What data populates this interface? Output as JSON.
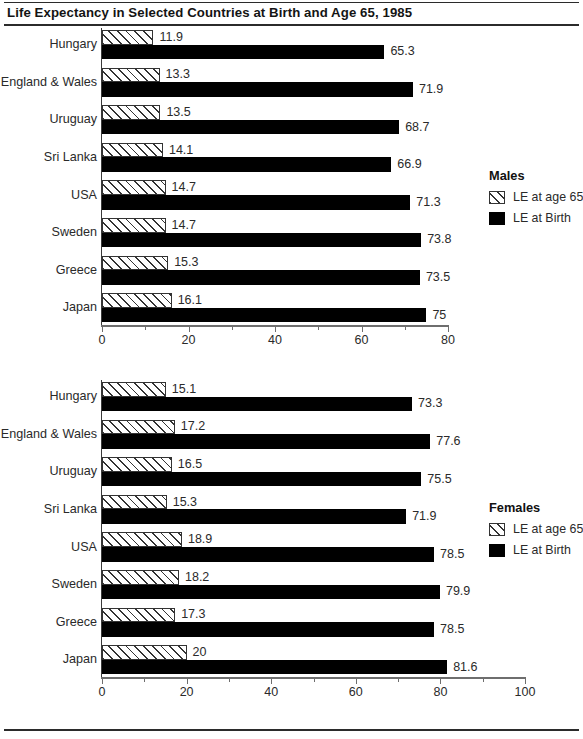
{
  "title": "Life Expectancy in Selected Countries at Birth and Age 65, 1985",
  "chart_data": [
    {
      "type": "bar",
      "id": "males",
      "title": "Males",
      "orientation": "horizontal",
      "grouping": "grouped",
      "categories": [
        "Hungary",
        "England & Wales",
        "Uruguay",
        "Sri Lanka",
        "USA",
        "Sweden",
        "Greece",
        "Japan"
      ],
      "series": [
        {
          "name": "LE at age 65",
          "style": "hatched",
          "values": [
            11.9,
            13.3,
            13.5,
            14.1,
            14.7,
            14.7,
            15.3,
            16.1
          ],
          "labels": [
            "11.9",
            "13.3",
            "13.5",
            "14.1",
            "14.7",
            "14.7",
            "15.3",
            "16.1"
          ]
        },
        {
          "name": "LE at Birth",
          "style": "solid-black",
          "values": [
            65.3,
            71.9,
            68.7,
            66.9,
            71.3,
            73.8,
            73.5,
            75
          ],
          "labels": [
            "65.3",
            "71.9",
            "68.7",
            "66.9",
            "71.3",
            "73.8",
            "73.5",
            "75"
          ]
        }
      ],
      "xlabel": "",
      "ylabel": "",
      "xlim": [
        0,
        80
      ],
      "xticks": [
        0,
        20,
        40,
        60,
        80
      ],
      "xtick_labels": [
        "0",
        "20",
        "40",
        "60",
        "80"
      ],
      "minor_tick_step": 10,
      "grid": false,
      "legend_position": "right"
    },
    {
      "type": "bar",
      "id": "females",
      "title": "Females",
      "orientation": "horizontal",
      "grouping": "grouped",
      "categories": [
        "Hungary",
        "England & Wales",
        "Uruguay",
        "Sri Lanka",
        "USA",
        "Sweden",
        "Greece",
        "Japan"
      ],
      "series": [
        {
          "name": "LE at age 65",
          "style": "hatched",
          "values": [
            15.1,
            17.2,
            16.5,
            15.3,
            18.9,
            18.2,
            17.3,
            20
          ],
          "labels": [
            "15.1",
            "17.2",
            "16.5",
            "15.3",
            "18.9",
            "18.2",
            "17.3",
            "20"
          ]
        },
        {
          "name": "LE at Birth",
          "style": "solid-black",
          "values": [
            73.3,
            77.6,
            75.5,
            71.9,
            78.5,
            79.9,
            78.5,
            81.6
          ],
          "labels": [
            "73.3",
            "77.6",
            "75.5",
            "71.9",
            "78.5",
            "79.9",
            "78.5",
            "81.6"
          ]
        }
      ],
      "xlabel": "",
      "ylabel": "",
      "xlim": [
        0,
        100
      ],
      "xticks": [
        0,
        20,
        40,
        60,
        80,
        100
      ],
      "xtick_labels": [
        "0",
        "20",
        "40",
        "60",
        "80",
        "100"
      ],
      "minor_tick_step": 10,
      "grid": false,
      "legend_position": "right"
    }
  ],
  "colors": {
    "bar_birth": "#000000",
    "bar_age65_fill": "#ffffff",
    "bar_age65_hatch": "#333333",
    "axis": "#6e6e6e",
    "text": "#2a2a2a",
    "rule": "#2b2b2b"
  }
}
